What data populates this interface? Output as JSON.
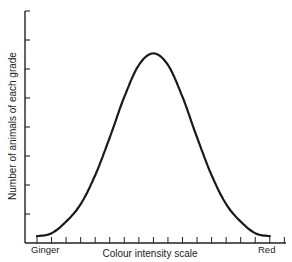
{
  "chart_data": {
    "type": "line",
    "title": "",
    "title_note": "title cropped at top edge, not legible",
    "xlabel": "Colour intensity scale",
    "ylabel": "Number of animals of each grade",
    "x_end_labels": {
      "left": "Ginger",
      "right": "Red"
    },
    "x": [
      0,
      1,
      2,
      3,
      4,
      5,
      6,
      7,
      8,
      9,
      10,
      11,
      12,
      13,
      14,
      15,
      16
    ],
    "x_tick_count": 18,
    "y_tick_count": 8,
    "series": [
      {
        "name": "Distribution",
        "values": [
          0.1,
          0.2,
          0.6,
          1.2,
          2.2,
          3.5,
          4.9,
          6.0,
          6.4,
          6.0,
          4.9,
          3.5,
          2.2,
          1.2,
          0.6,
          0.2,
          0.1
        ]
      }
    ],
    "xlim": [
      0,
      17
    ],
    "ylim": [
      0,
      8
    ],
    "grid": false,
    "legend": "none",
    "tick_labels_shown": false,
    "line_color": "#1a1a1a"
  }
}
